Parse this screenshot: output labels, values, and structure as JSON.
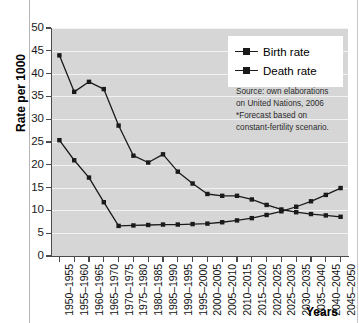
{
  "chart_data": {
    "type": "line",
    "title": "",
    "xlabel": "Years",
    "ylabel": "Rate per 1000",
    "ylim": [
      0,
      50
    ],
    "ytick_step": 5,
    "yticks": [
      0,
      5,
      10,
      15,
      20,
      25,
      30,
      35,
      40,
      45,
      50
    ],
    "grid": true,
    "legend_position": "top-right",
    "categories": [
      "1950–1955",
      "1955–1960",
      "1960–1965",
      "1965–1970",
      "1970–1975",
      "1975–1980",
      "1980–1985",
      "1985–1990",
      "1990–1995",
      "1995–2000",
      "2000–2005",
      "2005–2010",
      "2010–2015",
      "2015–2020",
      "2020–2025",
      "2025–2030",
      "2030–2035",
      "2035–2040",
      "2040–2045",
      "2045–2050"
    ],
    "series": [
      {
        "name": "Birth rate",
        "values": [
          44.0,
          36.0,
          38.2,
          36.6,
          28.6,
          22.0,
          20.5,
          22.3,
          18.5,
          15.9,
          13.6,
          13.2,
          13.2,
          12.4,
          11.2,
          10.2,
          9.6,
          9.2,
          8.9,
          8.6
        ]
      },
      {
        "name": "Death rate",
        "values": [
          25.4,
          21.0,
          17.2,
          11.8,
          6.6,
          6.7,
          6.8,
          6.9,
          6.9,
          7.0,
          7.1,
          7.4,
          7.8,
          8.3,
          9.0,
          9.8,
          10.8,
          12.0,
          13.4,
          14.9
        ]
      }
    ],
    "annotations": [
      "Source: own elaborations",
      "on United Nations, 2006",
      "*Forecast based on",
      "constant-fertility scenario."
    ]
  },
  "axes": {
    "y_title": "Rate per 1000",
    "x_title": "Years"
  },
  "legend": {
    "items": [
      {
        "label": "Birth rate",
        "marker": "square-line-marker",
        "color": "#1a1a1a"
      },
      {
        "label": "Death rate",
        "marker": "square-line-marker",
        "color": "#1a1a1a"
      }
    ]
  },
  "source_note": {
    "lines": [
      "Source: own elaborations",
      "on United Nations, 2006",
      "*Forecast based on",
      "constant-fertility scenario."
    ]
  },
  "colors": {
    "plot_background": "#d6d6d6",
    "gridline": "#f2f2f2",
    "series_line": "#1a1a1a",
    "axis": "#4a4a4a",
    "legend_background": "#ffffff",
    "page_background": "#ffffff"
  }
}
